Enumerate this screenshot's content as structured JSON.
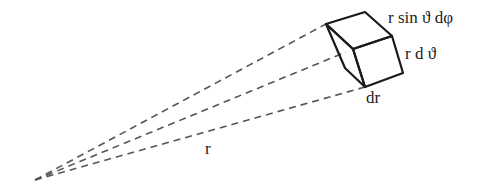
{
  "diagram": {
    "labels": {
      "r_sin_theta_dphi": "r sin ϑ dφ",
      "r_dtheta": "r d ϑ",
      "dr": "dr",
      "r": "r"
    },
    "colors": {
      "edge": "#1a1a1a",
      "dash": "#555555",
      "text": "#222222"
    }
  }
}
